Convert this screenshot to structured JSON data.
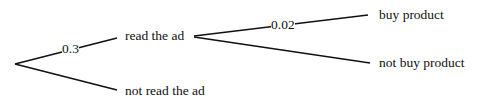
{
  "diagram": {
    "type": "probability-tree",
    "nodes": {
      "read": "read the ad",
      "not_read": "not read the ad",
      "buy": "buy product",
      "not_buy": "not buy product"
    },
    "edges": {
      "root_read_prob": "0.3",
      "read_buy_prob": "0.02"
    }
  }
}
